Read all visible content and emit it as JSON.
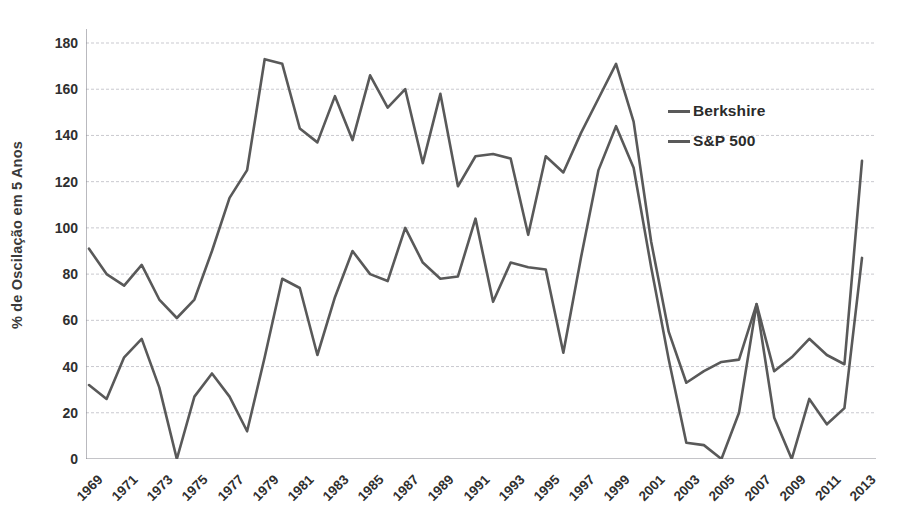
{
  "chart_data": {
    "type": "line",
    "title": "",
    "xlabel": "",
    "ylabel": "% de Oscilação em 5 Anos",
    "ylim": [
      0,
      180
    ],
    "yticks": [
      0,
      20,
      40,
      60,
      80,
      100,
      120,
      140,
      160,
      180
    ],
    "grid": true,
    "legend_position": "inside-right",
    "x": [
      1969,
      1970,
      1971,
      1972,
      1973,
      1974,
      1975,
      1976,
      1977,
      1978,
      1979,
      1980,
      1981,
      1982,
      1983,
      1984,
      1985,
      1986,
      1987,
      1988,
      1989,
      1990,
      1991,
      1992,
      1993,
      1994,
      1995,
      1996,
      1997,
      1998,
      1999,
      2000,
      2001,
      2002,
      2003,
      2004,
      2005,
      2006,
      2007,
      2008,
      2009,
      2010,
      2011,
      2012,
      2013
    ],
    "xtick_labels": [
      "1969",
      "1971",
      "1973",
      "1975",
      "1977",
      "1979",
      "1981",
      "1983",
      "1985",
      "1987",
      "1989",
      "1991",
      "1993",
      "1995",
      "1997",
      "1999",
      "2001",
      "2003",
      "2005",
      "2007",
      "2009",
      "2011",
      "2013"
    ],
    "series": [
      {
        "name": "Berkshire",
        "color": "#595959",
        "values": [
          91,
          80,
          75,
          84,
          69,
          61,
          69,
          90,
          113,
          125,
          173,
          171,
          143,
          137,
          157,
          138,
          166,
          152,
          160,
          128,
          158,
          118,
          131,
          132,
          130,
          97,
          131,
          124,
          141,
          156,
          171,
          146,
          94,
          55,
          33,
          38,
          42,
          43,
          67,
          38,
          44,
          52,
          45,
          41,
          129
        ]
      },
      {
        "name": "S&P 500",
        "color": "#595959",
        "values": [
          32,
          26,
          44,
          52,
          31,
          0,
          27,
          37,
          27,
          12,
          44,
          78,
          74,
          45,
          70,
          90,
          80,
          77,
          100,
          85,
          78,
          79,
          104,
          68,
          85,
          83,
          82,
          46,
          87,
          125,
          144,
          126,
          83,
          43,
          7,
          6,
          0,
          20,
          67,
          18,
          0,
          26,
          15,
          22,
          87
        ]
      }
    ]
  },
  "legend": {
    "items": [
      {
        "label": "Berkshire"
      },
      {
        "label": "S&P 500"
      }
    ]
  },
  "axis": {
    "y_title": "% de Oscilação em 5 Anos"
  }
}
